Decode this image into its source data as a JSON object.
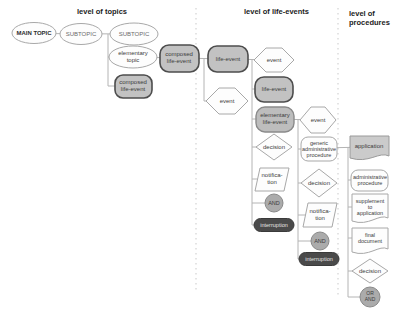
{
  "figure": {
    "headers": {
      "topics": "level of topics",
      "life_events": "level of life-events",
      "procedures": "level of\nprocedures"
    },
    "nodes": {
      "main_topic": "MAIN TOPIC",
      "subtopic_1": "SUBTOPIC",
      "subtopic_2": "SUBTOPIC",
      "elementary_topic": "elementary\ntopic",
      "composed_life_event_1": "composed\nlife-event",
      "composed_life_event_2": "composed\nlife-event",
      "life_event_1": "life-event",
      "event_1": "event",
      "life_event_2": "life-event",
      "event_2": "event",
      "elementary_life_event": "elementary\nlife-event",
      "event_3": "event",
      "decision_1": "decision",
      "generic_administrative_procedure": "generic\nadministrative\nprocedure",
      "notification_1": "notifica-\ntion",
      "decision_2": "decision",
      "and_1": "AND",
      "notification_2": "notifica-\ntion",
      "interruption_1": "interruption",
      "and_2": "AND",
      "interruption_2": "interruption",
      "application": "application",
      "administrative_procedure": "administrative\nprocedure",
      "supplement_to_application": "supplement\nto\napplication",
      "final_document": "final\ndocument",
      "decision_3": "decision",
      "or_and": "OR\nAND"
    },
    "colors": {
      "node_gray_fill": "#c2c2c2",
      "node_dark_border": "#4d4d4d",
      "node_light_border": "#a8a8a8",
      "interruption_fill": "#4a4a4a",
      "and_fill": "#ababab",
      "application_fill": "#cbcbcb",
      "white_fill": "#fdfdfd",
      "connector": "#b4b4b4",
      "separator": "#c9c9c9",
      "background": "#ffffff"
    }
  }
}
